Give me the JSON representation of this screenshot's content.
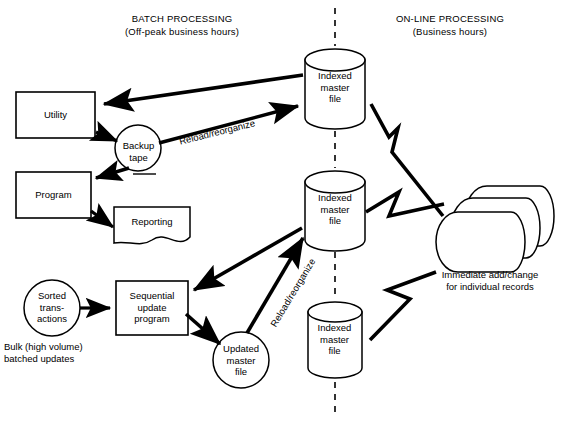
{
  "diagram": {
    "title_left": {
      "line1": "BATCH PROCESSING",
      "line2": "(Off-peak business hours)"
    },
    "title_right": {
      "line1": "ON-LINE PROCESSING",
      "line2": "(Business hours)"
    },
    "divider": {
      "style": "dashed-vertical",
      "color": "#000000"
    },
    "nodes": {
      "utility": {
        "label": "Utility",
        "shape": "rectangle"
      },
      "program": {
        "label": "Program",
        "shape": "rectangle"
      },
      "reporting": {
        "label": "Reporting",
        "shape": "document"
      },
      "backup_tape": {
        "label": "Backup\ntape",
        "shape": "circle-tape"
      },
      "sorted_transactions": {
        "label": "Sorted\ntrans-\nactions",
        "shape": "circle"
      },
      "sequential_update_program": {
        "label": "Sequential\nupdate\nprogram",
        "shape": "rectangle"
      },
      "updated_master_file": {
        "label": "Updated\nmaster\nfile",
        "shape": "circle"
      },
      "indexed_master_file_top": {
        "label": "Indexed\nmaster\nfile",
        "shape": "cylinder"
      },
      "indexed_master_file_middle": {
        "label": "Indexed\nmaster\nfile",
        "shape": "cylinder"
      },
      "indexed_master_file_bottom": {
        "label": "Indexed\nmaster\nfile",
        "shape": "cylinder"
      },
      "terminals": {
        "label": "",
        "shape": "stacked-display"
      }
    },
    "captions": {
      "bulk_updates": "Bulk (high volume)\nbatched updates",
      "immediate_add_change": "Immediate add/change\nfor individual records"
    },
    "edge_labels": {
      "reload_reorganize_top": "Reload/reorganize",
      "reload_reorganize_bottom": "Reload/reorganize"
    },
    "colors": {
      "stroke": "#000000",
      "fill": "#ffffff",
      "text": "#000000"
    }
  }
}
